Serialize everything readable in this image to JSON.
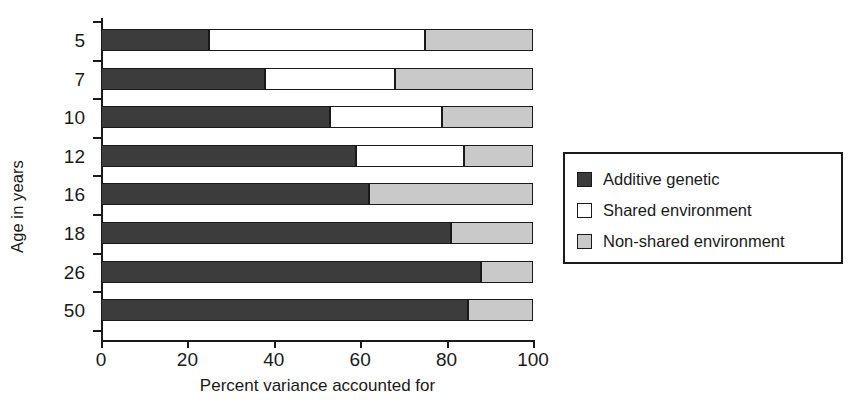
{
  "chart_data": {
    "type": "bar",
    "orientation": "horizontal",
    "stacked": true,
    "title": "",
    "xlabel": "Percent variance accounted for",
    "ylabel": "Age in years",
    "xlim": [
      0,
      100
    ],
    "xticks": [
      0,
      20,
      40,
      60,
      80,
      100
    ],
    "xtick_labels": [
      "0",
      "20",
      "40",
      "60",
      "80",
      "100"
    ],
    "categories": [
      "5",
      "7",
      "10",
      "12",
      "16",
      "18",
      "26",
      "50"
    ],
    "grid": false,
    "legend_position": "right",
    "series": [
      {
        "name": "Additive genetic",
        "color": "#3c3c3c",
        "values": [
          25,
          38,
          53,
          59,
          62,
          81,
          88,
          85
        ]
      },
      {
        "name": "Shared environment",
        "color": "#ffffff",
        "values": [
          50,
          30,
          26,
          25,
          0,
          0,
          0,
          0
        ]
      },
      {
        "name": "Non-shared environment",
        "color": "#c9c9c9",
        "values": [
          25,
          32,
          21,
          16,
          38,
          19,
          12,
          15
        ]
      }
    ]
  },
  "axes": {
    "y_title": "Age in years",
    "x_title": "Percent variance accounted for"
  },
  "legend": {
    "items": [
      {
        "label": "Additive genetic",
        "swatch": "#3c3c3c"
      },
      {
        "label": "Shared environment",
        "swatch": "#ffffff"
      },
      {
        "label": "Non-shared environment",
        "swatch": "#c9c9c9"
      }
    ]
  }
}
